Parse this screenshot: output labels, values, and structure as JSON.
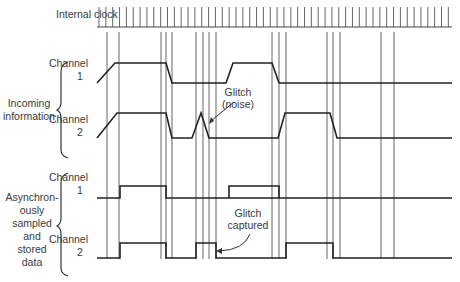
{
  "labels": {
    "clock": "Internal clock",
    "incoming_group": [
      "Incoming",
      "information"
    ],
    "stored_group": [
      "Asynchron-",
      "ously",
      "sampled",
      "and",
      "stored",
      "data"
    ],
    "incoming_ch1": [
      "Channel",
      "1"
    ],
    "incoming_ch2": [
      "Channel",
      "2"
    ],
    "stored_ch1": [
      "Channel",
      "1"
    ],
    "stored_ch2": [
      "Channel",
      "2"
    ],
    "glitch_noise": [
      "Glitch",
      "(noise)"
    ],
    "glitch_captured": [
      "Glitch",
      "captured"
    ]
  },
  "signals": {
    "clock_ticks": 52,
    "sample_times": [
      0,
      12,
      54,
      59,
      65,
      89,
      96,
      102,
      109,
      165,
      172,
      179,
      220,
      226,
      233,
      274,
      287
    ],
    "incoming_ch1": [
      [
        0,
        0
      ],
      [
        8,
        1
      ],
      [
        59,
        1
      ],
      [
        65,
        0
      ],
      [
        119,
        0
      ],
      [
        126,
        1
      ],
      [
        165,
        1
      ],
      [
        172,
        0
      ],
      [
        345,
        0
      ]
    ],
    "incoming_ch2": [
      [
        0,
        0
      ],
      [
        10,
        1
      ],
      [
        59,
        1
      ],
      [
        65,
        0
      ],
      [
        85,
        0
      ],
      [
        94,
        1
      ],
      [
        102,
        0
      ],
      [
        171,
        0
      ],
      [
        178,
        1
      ],
      [
        223,
        1
      ],
      [
        230,
        0
      ],
      [
        345,
        0
      ]
    ],
    "stored_ch1": [
      [
        0,
        0
      ],
      [
        13,
        0
      ],
      [
        13,
        1
      ],
      [
        59,
        1
      ],
      [
        59,
        0
      ],
      [
        345,
        0
      ]
    ],
    "stored_ch1_b": [
      [
        122,
        0
      ],
      [
        122,
        1
      ],
      [
        172,
        1
      ],
      [
        172,
        0
      ]
    ],
    "stored_ch2": [
      [
        0,
        0
      ],
      [
        13,
        0
      ],
      [
        13,
        1
      ],
      [
        59,
        1
      ],
      [
        59,
        0
      ],
      [
        89,
        0
      ],
      [
        89,
        1
      ],
      [
        109,
        1
      ],
      [
        109,
        0
      ],
      [
        179,
        0
      ],
      [
        179,
        1
      ],
      [
        226,
        1
      ],
      [
        226,
        0
      ],
      [
        345,
        0
      ]
    ]
  }
}
